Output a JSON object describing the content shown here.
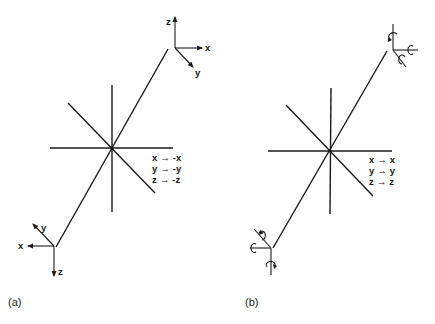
{
  "figure": {
    "panels": [
      {
        "caption": "(a)",
        "description": "Inversion",
        "top_frame_axes": {
          "z": "z",
          "x": "x",
          "y": "y"
        },
        "bottom_frame_axes": {
          "x": "x",
          "y": "y",
          "z": "z"
        },
        "mapping": [
          {
            "from": "x",
            "arrow": "→",
            "to": "-x"
          },
          {
            "from": "y",
            "arrow": "→",
            "to": "-y"
          },
          {
            "from": "z",
            "arrow": "→",
            "to": "-z"
          }
        ]
      },
      {
        "caption": "(b)",
        "description": "Rotation vectors (axial) under inversion",
        "mapping": [
          {
            "from": "x",
            "arrow": "→",
            "to": "x"
          },
          {
            "from": "y",
            "arrow": "→",
            "to": "y"
          },
          {
            "from": "z",
            "arrow": "→",
            "to": "z"
          }
        ]
      }
    ]
  }
}
